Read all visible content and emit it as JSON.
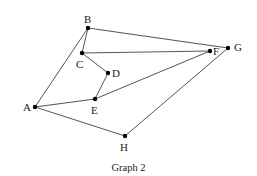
{
  "caption": "Graph 2",
  "colors": {
    "edge": "#555555",
    "node": "#000000",
    "text": "#222222"
  },
  "nodes": [
    {
      "id": "A",
      "label": "A",
      "x": 35,
      "y": 107,
      "lx": 23,
      "ly": 102
    },
    {
      "id": "B",
      "label": "B",
      "x": 88,
      "y": 28,
      "lx": 84,
      "ly": 14
    },
    {
      "id": "C",
      "label": "C",
      "x": 82,
      "y": 53,
      "lx": 76,
      "ly": 59
    },
    {
      "id": "D",
      "label": "D",
      "x": 108,
      "y": 73,
      "lx": 112,
      "ly": 68
    },
    {
      "id": "E",
      "label": "E",
      "x": 95,
      "y": 99,
      "lx": 91,
      "ly": 105
    },
    {
      "id": "F",
      "label": "F",
      "x": 210,
      "y": 51,
      "lx": 213,
      "ly": 46
    },
    {
      "id": "G",
      "label": "G",
      "x": 228,
      "y": 48,
      "lx": 234,
      "ly": 42
    },
    {
      "id": "H",
      "label": "H",
      "x": 125,
      "y": 136,
      "lx": 120,
      "ly": 142
    }
  ],
  "edges": [
    [
      "A",
      "B"
    ],
    [
      "B",
      "C"
    ],
    [
      "B",
      "G"
    ],
    [
      "C",
      "F"
    ],
    [
      "C",
      "D"
    ],
    [
      "D",
      "E"
    ],
    [
      "A",
      "E"
    ],
    [
      "E",
      "F"
    ],
    [
      "A",
      "H"
    ],
    [
      "H",
      "G"
    ]
  ]
}
